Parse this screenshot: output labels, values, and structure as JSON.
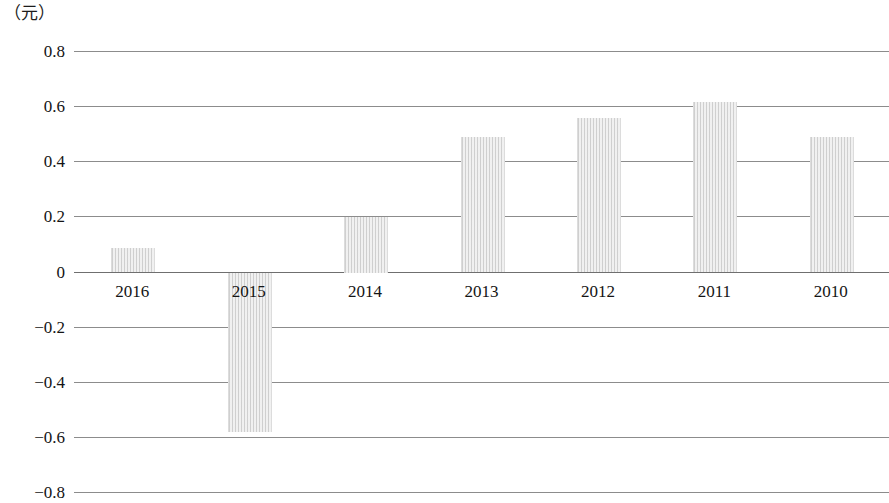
{
  "chart_data": {
    "type": "bar",
    "title": "",
    "subtitle": "",
    "xlabel": "",
    "ylabel": "",
    "unit_label": "（元）",
    "categories": [
      "2016",
      "2015",
      "2014",
      "2013",
      "2012",
      "2011",
      "2010"
    ],
    "values": [
      0.09,
      -0.58,
      0.2,
      0.49,
      0.56,
      0.62,
      0.49
    ],
    "series": [
      {
        "name": "",
        "values": [
          0.09,
          -0.58,
          0.2,
          0.49,
          0.56,
          0.62,
          0.49
        ]
      }
    ],
    "ylim": [
      -0.8,
      0.8
    ],
    "ytick_labels": [
      "0.8",
      "0.6",
      "0.4",
      "0.2",
      "0",
      "−0.2",
      "−0.4",
      "−0.6",
      "−0.8"
    ],
    "ytick_values": [
      0.8,
      0.6,
      0.4,
      0.2,
      0,
      -0.2,
      -0.4,
      -0.6,
      -0.8
    ],
    "grid": true,
    "grid_orientation": "horizontal",
    "legend": false,
    "legend_position": "none",
    "bar_color": "#e9e9e9",
    "gridline_color": "#8c8c8c",
    "zero_line_color": "#6f6f6f",
    "text_color": "#141414",
    "background_color": "#ffffff",
    "annotations": []
  },
  "axis": {
    "y_ticks": [
      {
        "label": "0.8",
        "value": 0.8
      },
      {
        "label": "0.6",
        "value": 0.6
      },
      {
        "label": "0.4",
        "value": 0.4
      },
      {
        "label": "0.2",
        "value": 0.2
      },
      {
        "label": "0",
        "value": 0
      },
      {
        "label": "−0.2",
        "value": -0.2
      },
      {
        "label": "−0.4",
        "value": -0.4
      },
      {
        "label": "−0.6",
        "value": -0.6
      },
      {
        "label": "−0.8",
        "value": -0.8
      }
    ],
    "x_ticks": [
      {
        "label": "2016"
      },
      {
        "label": "2015"
      },
      {
        "label": "2014"
      },
      {
        "label": "2013"
      },
      {
        "label": "2012"
      },
      {
        "label": "2011"
      },
      {
        "label": "2010"
      }
    ]
  }
}
